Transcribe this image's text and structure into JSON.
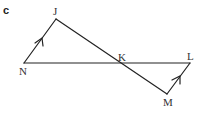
{
  "part": "c",
  "points": {
    "J": {
      "label": "J",
      "x": 56,
      "y": 19
    },
    "N": {
      "label": "N",
      "x": 24,
      "y": 63
    },
    "K": {
      "label": "K",
      "x": 122,
      "y": 63
    },
    "L": {
      "label": "L",
      "x": 190,
      "y": 63
    },
    "M": {
      "label": "M",
      "x": 167,
      "y": 94
    }
  },
  "segments": [
    "NJ",
    "JM",
    "NL",
    "LM"
  ],
  "parallel_marks": [
    "NJ",
    "ML"
  ],
  "line_color": "#222222"
}
